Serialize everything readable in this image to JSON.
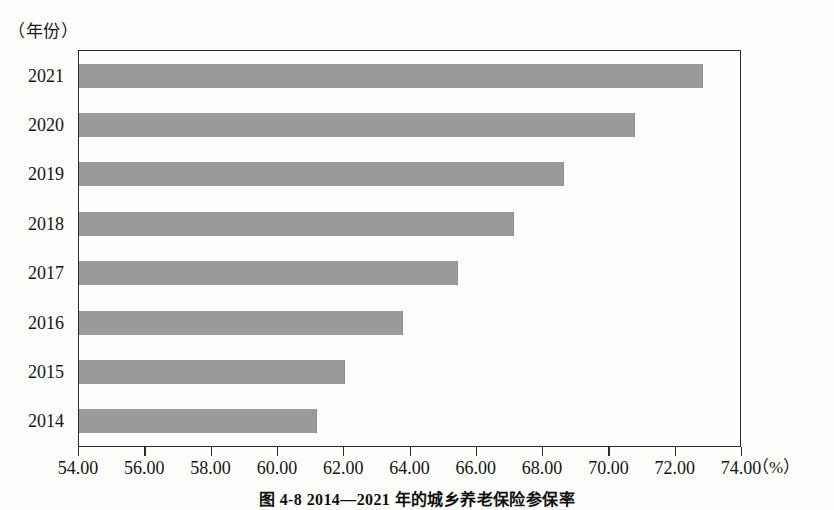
{
  "figure": {
    "y_axis_unit": "（年份）",
    "x_axis_unit": "（%）",
    "caption": "图 4-8  2014—2021 年的城乡养老保险参保率",
    "bar_color": "#9a9a9a",
    "frame_color": "#2b2b2b",
    "background": "#fdfdfb"
  },
  "chart_data": {
    "type": "bar",
    "orientation": "horizontal",
    "title": "图 4-8  2014—2021 年的城乡养老保险参保率",
    "xlabel": "（%）",
    "ylabel": "（年份）",
    "categories": [
      "2021",
      "2020",
      "2019",
      "2018",
      "2017",
      "2016",
      "2015",
      "2014"
    ],
    "values": [
      72.8,
      70.75,
      68.6,
      67.1,
      65.4,
      63.75,
      62.0,
      61.15
    ],
    "xlim": [
      54.0,
      74.0
    ],
    "xticks": [
      54.0,
      56.0,
      58.0,
      60.0,
      62.0,
      64.0,
      66.0,
      68.0,
      70.0,
      72.0,
      74.0
    ],
    "xtick_labels": [
      "54.00",
      "56.00",
      "58.00",
      "60.00",
      "62.00",
      "64.00",
      "66.00",
      "68.00",
      "70.00",
      "72.00",
      "74.00"
    ],
    "grid": false,
    "legend": null,
    "series": [
      {
        "name": "城乡养老保险参保率",
        "values": [
          72.8,
          70.75,
          68.6,
          67.1,
          65.4,
          63.75,
          62.0,
          61.15
        ]
      }
    ]
  }
}
